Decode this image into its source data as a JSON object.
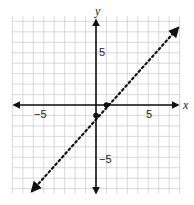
{
  "chart_data": {
    "type": "line",
    "title": "",
    "xlabel": "x",
    "ylabel": "y",
    "xlim": [
      -8,
      8
    ],
    "ylim": [
      -8,
      8
    ],
    "grid": true,
    "tick_labels": {
      "x": [
        {
          "value": -5,
          "label": "−5"
        },
        {
          "value": 5,
          "label": "5"
        }
      ],
      "y": [
        {
          "value": 5,
          "label": "5"
        },
        {
          "value": -5,
          "label": "−5"
        }
      ]
    },
    "series": [
      {
        "name": "y = x - 1",
        "style": "dotted",
        "arrows": "both",
        "equation": "y = x - 1",
        "x": [
          -6,
          7
        ],
        "y": [
          -7,
          6
        ]
      }
    ],
    "points": [
      {
        "x": 0,
        "y": -1
      },
      {
        "x": 1,
        "y": 0
      }
    ]
  },
  "labels": {
    "x_axis": "x",
    "y_axis": "y",
    "x_neg5": "−5",
    "x_pos5": "5",
    "y_pos5": "5",
    "y_neg5": "−5"
  }
}
